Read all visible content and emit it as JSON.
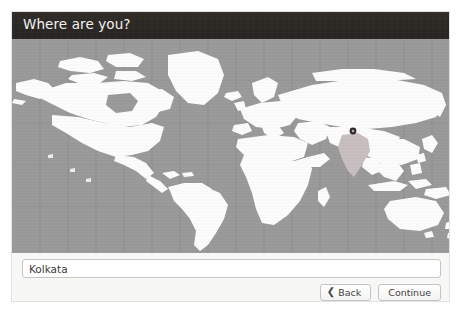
{
  "window": {
    "title": "Where are you?"
  },
  "map": {
    "ocean_color": "#9a9a9a",
    "land_color": "#fdfdfd",
    "highlight_color": "#c9bfc0",
    "grid_color": "#8f8f8f",
    "marker_color": "#2d2a28",
    "highlighted_region": "India",
    "selected_city_marker": "location-marker"
  },
  "location": {
    "value": "Kolkata",
    "placeholder": "Enter a city or region"
  },
  "buttons": {
    "back_label": "Back",
    "back_icon": "chevron-left-icon",
    "continue_label": "Continue"
  }
}
